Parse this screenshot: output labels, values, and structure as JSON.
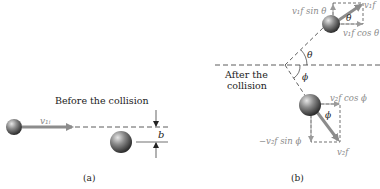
{
  "panel_a": {
    "title": "Before the collision",
    "velocity_label": "v₁ᵢ",
    "impact_parameter_label": "b",
    "caption": "(a)"
  },
  "panel_b": {
    "title_line1": "After the",
    "title_line2": "collision",
    "v1f_label": "v₁f",
    "v1f_sin_label": "v₁f sin θ",
    "v1f_cos_label": "v₁f cos θ",
    "theta_label": "θ",
    "theta_inner_label": "θ",
    "phi_label": "ϕ",
    "phi_inner_label": "ϕ",
    "v2f_label": "v₂f",
    "v2f_cos_label": "v₂f cos ϕ",
    "v2f_sin_label": "−v₂f sin ϕ",
    "caption": "(b)"
  },
  "colors": {
    "arrow": "#8c8c8c",
    "dashed_line": "#333333",
    "ball_light": "#d9d9d9",
    "ball_dark": "#3a3a3a"
  }
}
